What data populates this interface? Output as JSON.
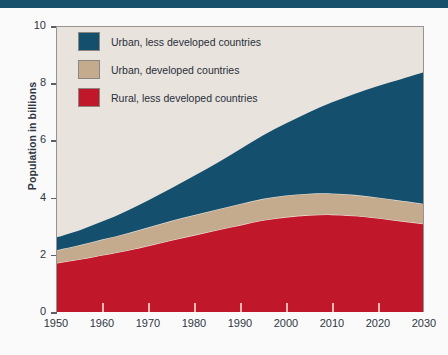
{
  "banner": {
    "color": "#17506b"
  },
  "chart_data": {
    "type": "area",
    "stacked": true,
    "title": "",
    "xlabel": "",
    "ylabel": "Population in billions",
    "xlim": [
      1950,
      2030
    ],
    "ylim": [
      0,
      10
    ],
    "yticks": [
      0,
      2,
      4,
      6,
      8,
      10
    ],
    "xticks": [
      1950,
      1960,
      1970,
      1980,
      1990,
      2000,
      2010,
      2020,
      2030
    ],
    "grid": false,
    "legend_position": "upper-left",
    "x": [
      1950,
      1955,
      1960,
      1965,
      1970,
      1975,
      1980,
      1985,
      1990,
      1995,
      2000,
      2005,
      2010,
      2015,
      2020,
      2025,
      2030
    ],
    "series": [
      {
        "name": "Rural, less developed countries",
        "color": "#c0172a",
        "values": [
          1.72,
          1.85,
          2.0,
          2.15,
          2.33,
          2.52,
          2.7,
          2.88,
          3.05,
          3.22,
          3.33,
          3.4,
          3.42,
          3.38,
          3.3,
          3.2,
          3.1
        ]
      },
      {
        "name": "Urban, developed countries",
        "color": "#c4ab8e",
        "values": [
          0.45,
          0.5,
          0.55,
          0.6,
          0.64,
          0.68,
          0.7,
          0.72,
          0.74,
          0.75,
          0.76,
          0.75,
          0.74,
          0.73,
          0.72,
          0.71,
          0.7
        ]
      },
      {
        "name": "Urban, less developed countries",
        "color": "#14506e",
        "values": [
          0.45,
          0.52,
          0.63,
          0.78,
          0.95,
          1.14,
          1.38,
          1.63,
          1.92,
          2.22,
          2.52,
          2.85,
          3.19,
          3.54,
          3.9,
          4.25,
          4.6
        ]
      }
    ],
    "totals": [
      2.62,
      2.87,
      3.18,
      3.53,
      3.92,
      4.34,
      4.78,
      5.23,
      5.71,
      6.19,
      6.61,
      7.0,
      7.35,
      7.65,
      7.92,
      8.16,
      8.4
    ]
  },
  "legend": {
    "items": [
      {
        "label": "Urban, less developed countries",
        "color": "#14506e"
      },
      {
        "label": "Urban, developed countries",
        "color": "#c4ab8e"
      },
      {
        "label": "Rural, less developed countries",
        "color": "#c0172a"
      }
    ]
  },
  "axes": {
    "y_title": "Population in billions",
    "y_labels": [
      "10",
      "8",
      "6",
      "4",
      "2",
      "0"
    ],
    "x_labels": [
      "1950",
      "1960",
      "1970",
      "1980",
      "1990",
      "2000",
      "2010",
      "2020",
      "2030"
    ]
  }
}
